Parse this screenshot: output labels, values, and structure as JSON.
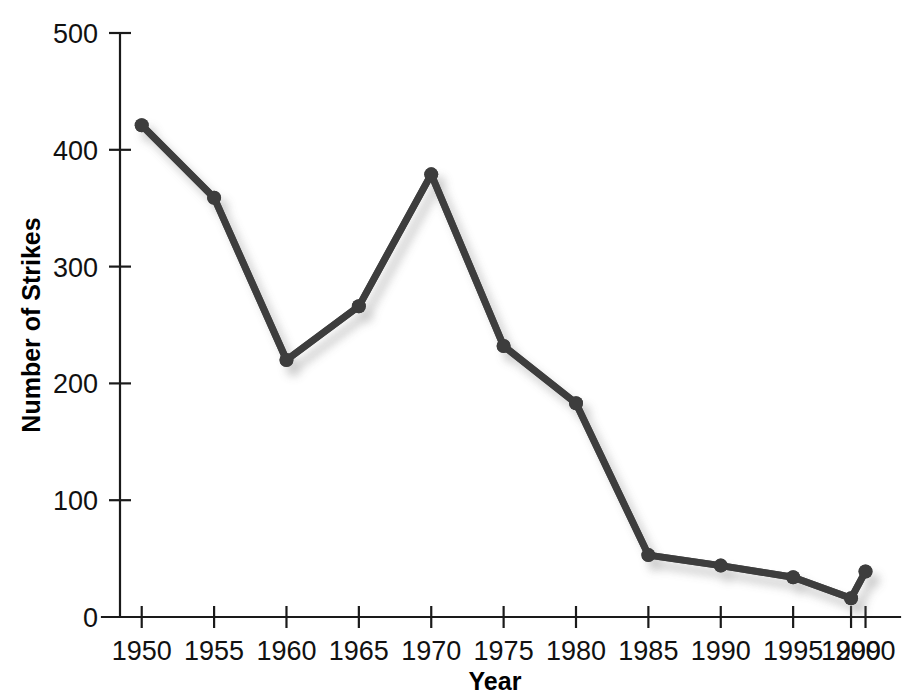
{
  "chart_data": {
    "type": "line",
    "title": "",
    "xlabel": "Year",
    "ylabel": "Number of Strikes",
    "x": [
      1950,
      1955,
      1960,
      1965,
      1970,
      1975,
      1980,
      1985,
      1990,
      1995,
      1999,
      2000
    ],
    "values": [
      421,
      359,
      220,
      266,
      379,
      232,
      183,
      53,
      44,
      34,
      16,
      39
    ],
    "xlim": [
      1948.5,
      2001
    ],
    "ylim": [
      0,
      500
    ],
    "ytick_labels": [
      "0",
      "100",
      "200",
      "300",
      "400",
      "500"
    ],
    "ytick_values": [
      0,
      100,
      200,
      300,
      400,
      500
    ],
    "xtick_labels": [
      "1950",
      "1955",
      "1960",
      "1965",
      "1970",
      "1975",
      "1980",
      "1985",
      "1990",
      "1995",
      "1999",
      "2000"
    ],
    "xtick_values": [
      1950,
      1955,
      1960,
      1965,
      1970,
      1975,
      1980,
      1985,
      1990,
      1995,
      1999,
      2000
    ],
    "grid": false,
    "legend": null,
    "series_color": "#3d3d3d",
    "marker": "circle",
    "marker_radius": 7,
    "axis_color": "#1a1a1a"
  }
}
